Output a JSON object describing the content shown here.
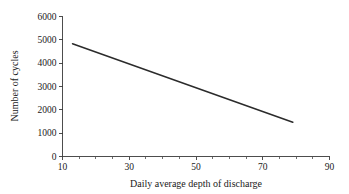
{
  "chart_data": {
    "type": "line",
    "title": "",
    "xlabel": "Daily average depth of discharge",
    "ylabel": "Number of cycles",
    "xlim": [
      10,
      90
    ],
    "ylim": [
      0,
      6000
    ],
    "xticks": [
      10,
      30,
      50,
      70,
      90
    ],
    "xtick_labels": [
      "10",
      "30",
      "50",
      "70",
      "90"
    ],
    "xminor_ticks": [
      15,
      20,
      25,
      35,
      40,
      45,
      55,
      60,
      65,
      75,
      80,
      85
    ],
    "yticks": [
      0,
      1000,
      2000,
      3000,
      4000,
      5000,
      6000
    ],
    "ytick_labels": [
      "0",
      "1000",
      "2000",
      "3000",
      "4000",
      "5000",
      "6000"
    ],
    "grid": false,
    "legend": false,
    "legend_position": "none",
    "line_color": "#2b2b2b",
    "axis_color": "#3a3a3a",
    "background_color": "#ffffff",
    "series": [
      {
        "name": "Number of cycles vs depth of discharge",
        "x": [
          13,
          79
        ],
        "values": [
          4830,
          1470
        ]
      }
    ]
  },
  "axes": {
    "y_label_text": "Number of cycles",
    "x_label_text": "Daily average depth of discharge"
  }
}
